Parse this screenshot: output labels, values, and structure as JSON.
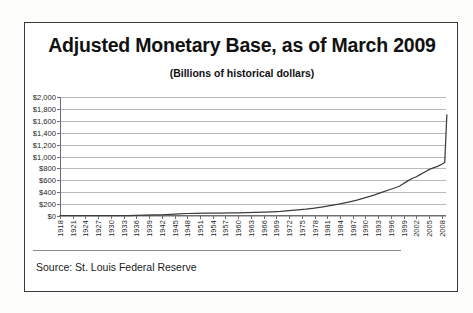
{
  "header": {
    "title": "Adjusted Monetary Base, as of March 2009",
    "subtitle": "(Billions of historical dollars)"
  },
  "footer": {
    "source": "Source: St. Louis Federal Reserve"
  },
  "colors": {
    "frame_border": "#3a3a3a",
    "gridline": "#b9b9b9",
    "axis": "#6e6e6e",
    "series_line": "#3d3d3d",
    "background": "#ffffff",
    "text": "#1a1a1a"
  },
  "chart_data": {
    "type": "line",
    "title": "Adjusted Monetary Base, as of March 2009",
    "subtitle": "(Billions of historical dollars)",
    "xlabel": "",
    "ylabel": "",
    "ylim": [
      0,
      2000
    ],
    "ytick_step": 200,
    "ytick_labels": [
      "$2,000",
      "$1,800",
      "$1,600",
      "$1,400",
      "$1,200",
      "$1,000",
      "$800",
      "$600",
      "$400",
      "$200",
      "$0"
    ],
    "ytick_values": [
      2000,
      1800,
      1600,
      1400,
      1200,
      1000,
      800,
      600,
      400,
      200,
      0
    ],
    "xlim": [
      1918,
      2009
    ],
    "xtick_labels": [
      "1918",
      "1921",
      "1924",
      "1927",
      "1930",
      "1933",
      "1936",
      "1939",
      "1942",
      "1945",
      "1948",
      "1951",
      "1954",
      "1957",
      "1960",
      "1963",
      "1966",
      "1969",
      "1972",
      "1975",
      "1978",
      "1981",
      "1984",
      "1987",
      "1990",
      "1993",
      "1996",
      "1999",
      "2002",
      "2005",
      "2008"
    ],
    "xtick_values": [
      1918,
      1921,
      1924,
      1927,
      1930,
      1933,
      1936,
      1939,
      1942,
      1945,
      1948,
      1951,
      1954,
      1957,
      1960,
      1963,
      1966,
      1969,
      1972,
      1975,
      1978,
      1981,
      1984,
      1987,
      1990,
      1993,
      1996,
      1999,
      2002,
      2005,
      2008
    ],
    "grid": true,
    "legend": false,
    "series": [
      {
        "name": "Adjusted Monetary Base",
        "x": [
          1918,
          1920,
          1922,
          1924,
          1926,
          1928,
          1930,
          1932,
          1934,
          1936,
          1938,
          1940,
          1942,
          1944,
          1946,
          1948,
          1950,
          1952,
          1954,
          1956,
          1958,
          1960,
          1962,
          1964,
          1966,
          1968,
          1970,
          1972,
          1974,
          1976,
          1978,
          1980,
          1982,
          1984,
          1986,
          1988,
          1990,
          1992,
          1994,
          1996,
          1998,
          1999,
          2000,
          2001,
          2002,
          2003,
          2004,
          2005,
          2006,
          2007,
          2008,
          2008.7,
          2009.2
        ],
        "values": [
          5,
          6,
          6,
          7,
          7,
          7,
          7,
          7,
          8,
          11,
          13,
          17,
          21,
          28,
          36,
          42,
          45,
          47,
          48,
          50,
          51,
          52,
          55,
          60,
          64,
          70,
          78,
          90,
          104,
          116,
          133,
          155,
          178,
          202,
          235,
          268,
          310,
          350,
          400,
          450,
          500,
          545,
          590,
          630,
          660,
          700,
          740,
          780,
          810,
          835,
          870,
          900,
          1700
        ]
      }
    ],
    "annotations": [
      {
        "text": "sharp vertical spike at end of series (late 2008 - March 2009)",
        "approx_x": 2008.8,
        "from": 900,
        "to": 1700
      }
    ]
  }
}
